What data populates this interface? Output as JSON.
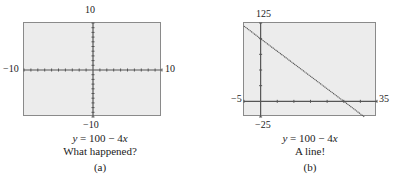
{
  "chart_data": [
    {
      "type": "line",
      "panel": "(a)",
      "title": "y = 100 − 4x",
      "subtitle": "What happened?",
      "equation": "y = 100 - 4x",
      "xlim": [
        -10,
        10
      ],
      "ylim": [
        -10,
        10
      ],
      "tick_labels": {
        "xmin": "−10",
        "xmax": "10",
        "ymin": "−10",
        "ymax": "10"
      },
      "xticks_per_side": 10,
      "yticks_per_side": 10,
      "grid": false,
      "series": [
        {
          "name": "y = 100 - 4x",
          "x": [],
          "y": [],
          "visible_in_window": false
        }
      ],
      "caption": "(a)"
    },
    {
      "type": "line",
      "panel": "(b)",
      "title": "y = 100 − 4x",
      "subtitle": "A line!",
      "equation": "y = 100 - 4x",
      "xlim": [
        -5,
        35
      ],
      "ylim": [
        -25,
        125
      ],
      "tick_labels": {
        "xmin": "−5",
        "xmax": "35",
        "ymin": "−25",
        "ymax": "125"
      },
      "xtick_step": 5,
      "ytick_step": 25,
      "grid": false,
      "series": [
        {
          "name": "y = 100 - 4x",
          "x": [
            -5,
            0,
            25,
            31.25
          ],
          "y": [
            120,
            100,
            0,
            -25
          ],
          "visible_in_window": true
        }
      ],
      "caption": "(b)"
    }
  ],
  "panels": {
    "a": {
      "label_top": "10",
      "label_bottom": "−10",
      "label_left": "−10",
      "label_right": "10",
      "eq_y": "y",
      "eq_rest": " = 100 − 4",
      "eq_x": "x",
      "comment": "What happened?",
      "caption": "(a)"
    },
    "b": {
      "label_top": "125",
      "label_bottom": "−25",
      "label_left": "−5",
      "label_right": "35",
      "eq_y": "y",
      "eq_rest": " = 100 − 4",
      "eq_x": "x",
      "comment": "A line!",
      "caption": "(b)"
    }
  },
  "colors": {
    "plot_bg": "#ececec",
    "axis": "#555555",
    "line": "#555555",
    "frame": "#8a8a8a"
  }
}
